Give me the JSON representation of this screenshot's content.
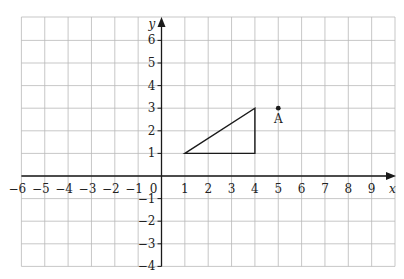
{
  "chart_data": {
    "type": "coordinate-grid",
    "xlabel": "x",
    "ylabel": "y",
    "xlim": [
      -6,
      10
    ],
    "ylim": [
      -4,
      7
    ],
    "x_ticks": [
      -6,
      -5,
      -4,
      -3,
      -2,
      -1,
      0,
      1,
      2,
      3,
      4,
      5,
      6,
      7,
      8,
      9
    ],
    "y_ticks": [
      -4,
      -3,
      -2,
      -1,
      1,
      2,
      3,
      4,
      5,
      6
    ],
    "grid": true,
    "shapes": [
      {
        "name": "triangle",
        "vertices": [
          [
            1,
            1
          ],
          [
            4,
            3
          ],
          [
            4,
            1
          ]
        ]
      }
    ],
    "points": [
      {
        "label": "A",
        "x": 5,
        "y": 3
      }
    ]
  },
  "labels": {
    "x_axis": "x",
    "y_axis": "y",
    "origin": "0",
    "point_a": "A",
    "x_tick_labels": [
      "−6",
      "−5",
      "−4",
      "−3",
      "−2",
      "−1",
      "1",
      "2",
      "3",
      "4",
      "5",
      "6",
      "7",
      "8",
      "9"
    ],
    "y_tick_labels": [
      "6",
      "5",
      "4",
      "3",
      "2",
      "1",
      "−1",
      "−2",
      "−3",
      "−4"
    ]
  }
}
